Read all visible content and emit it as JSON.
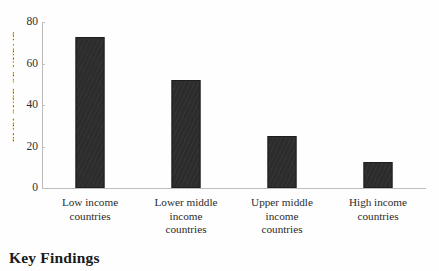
{
  "chart_data": {
    "type": "bar",
    "title": "",
    "xlabel": "",
    "ylabel": "EMPLOYED OR UNPAID",
    "categories": [
      "Low income\ncountries",
      "Lower middle\nincome\ncountries",
      "Upper middle\nincome\ncountries",
      "High income\ncountries"
    ],
    "category_lines": [
      [
        "Low income",
        "countries"
      ],
      [
        "Lower middle",
        "income",
        "countries"
      ],
      [
        "Upper middle",
        "income",
        "countries"
      ],
      [
        "High income",
        "countries"
      ]
    ],
    "values": [
      73,
      52,
      25,
      12.5
    ],
    "ylim": [
      0,
      80
    ],
    "yticks": [
      0,
      20,
      40,
      60,
      80
    ],
    "ytick_labels": [
      "0",
      "20",
      "40",
      "60",
      "80"
    ],
    "grid": false,
    "legend": false,
    "bar_color": "#2c2c2c",
    "axis_color": "#bdbdbd"
  },
  "footer": {
    "heading": "Key Findings"
  }
}
